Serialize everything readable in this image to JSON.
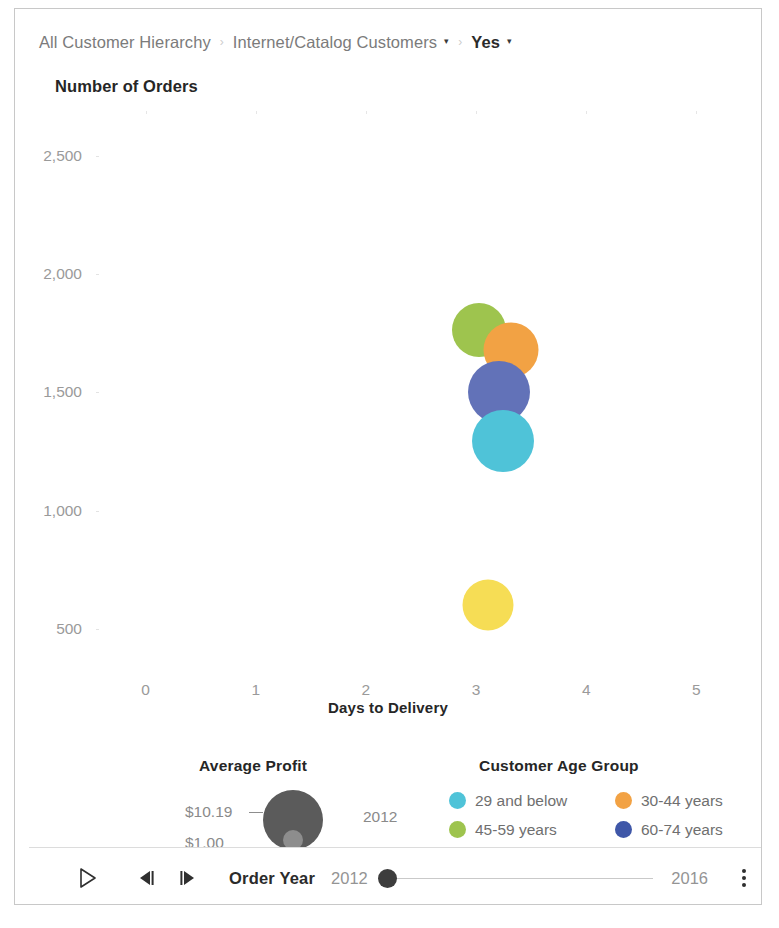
{
  "breadcrumb": {
    "items": [
      {
        "label": "All Customer Hierarchy",
        "has_caret": false,
        "strong": false
      },
      {
        "label": "Internet/Catalog Customers",
        "has_caret": true,
        "strong": false
      },
      {
        "label": "Yes",
        "has_caret": true,
        "strong": true
      }
    ],
    "separator": "›",
    "caret": "▾"
  },
  "chart_data": {
    "type": "scatter",
    "title": "Number of Orders",
    "xlabel": "Days to Delivery",
    "ylabel": "Number of Orders",
    "xlim": [
      -0.45,
      5.45
    ],
    "ylim": [
      330,
      2690
    ],
    "xticks": [
      "0",
      "1",
      "2",
      "3",
      "4",
      "5"
    ],
    "xtick_values": [
      0,
      1,
      2,
      3,
      4,
      5
    ],
    "yticks": [
      "2,500",
      "2,000",
      "1,500",
      "1,000",
      "500"
    ],
    "ytick_values": [
      2500,
      2000,
      1500,
      1000,
      500
    ],
    "grid": true,
    "size_field": "Average Profit",
    "color_field": "Customer Age Group",
    "points": [
      {
        "label": "45-59 years",
        "x": 3.03,
        "y": 1765,
        "size": 54,
        "color": "#9ec44e"
      },
      {
        "label": "30-44 years",
        "x": 3.32,
        "y": 1680,
        "size": 55,
        "color": "#f2a244"
      },
      {
        "label": "60-74 years",
        "x": 3.21,
        "y": 1500,
        "size": 62,
        "color": "#6272b8"
      },
      {
        "label": "29 and below",
        "x": 3.24,
        "y": 1295,
        "size": 62,
        "color": "#4fc3d8"
      },
      {
        "label": "75 and above",
        "x": 3.11,
        "y": 600,
        "size": 51,
        "color": "#f6dd55"
      }
    ],
    "legends": {
      "size": {
        "title": "Average Profit",
        "max_label": "$10.19",
        "min_label": "$1.00",
        "year_label": "2012"
      },
      "color": {
        "title": "Customer Age Group",
        "position": "bottom",
        "entries": [
          {
            "label": "29 and below",
            "color": "#4fc3d8"
          },
          {
            "label": "30-44 years",
            "color": "#f2a244"
          },
          {
            "label": "45-59 years",
            "color": "#9ec44e"
          },
          {
            "label": "60-74 years",
            "color": "#3f57a8"
          }
        ]
      }
    }
  },
  "play_axis": {
    "field_label": "Order Year",
    "start_value": "2012",
    "end_value": "2016",
    "play_icon": "play-icon",
    "step_back_icon": "step-backward-icon",
    "step_forward_icon": "step-forward-icon",
    "more_icon": "more-options-icon"
  }
}
